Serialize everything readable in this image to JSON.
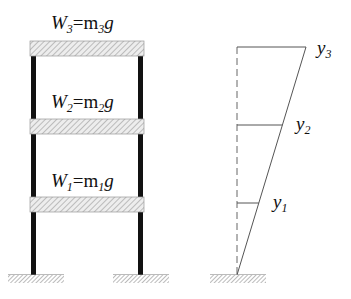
{
  "frame": {
    "floors": [
      {
        "name": "W",
        "sub": "3",
        "eq": "=m",
        "msub": "3",
        "g": "g"
      },
      {
        "name": "W",
        "sub": "2",
        "eq": "=m",
        "msub": "2",
        "g": "g"
      },
      {
        "name": "W",
        "sub": "1",
        "eq": "=m",
        "msub": "1",
        "g": "g"
      }
    ]
  },
  "deflection": {
    "labels": [
      {
        "name": "y",
        "sub": "3"
      },
      {
        "name": "y",
        "sub": "2"
      },
      {
        "name": "y",
        "sub": "1"
      }
    ]
  },
  "colors": {
    "slab_fill": "#e6e6e6",
    "hatch": "#8a8a8a",
    "column": "#111111",
    "line": "#555555"
  }
}
